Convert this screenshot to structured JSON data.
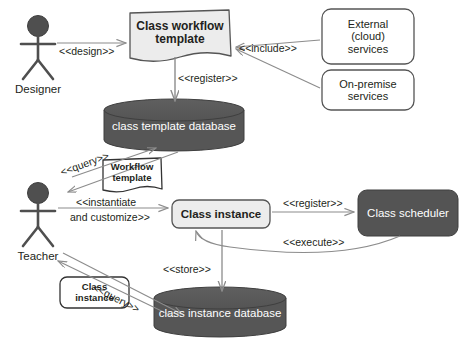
{
  "diagram": {
    "type": "uml-component-diagram",
    "colors": {
      "dark_fill": "#595959",
      "light_fill": "#eeeeee",
      "white_fill": "#ffffff",
      "stroke": "#4d4d4d",
      "text_dark": "#231f20",
      "text_light": "#ffffff",
      "arrow": "#8c8c8c"
    }
  },
  "actors": [
    {
      "id": "designer",
      "name": "Designer",
      "icon": "actor-stick-figure-icon"
    },
    {
      "id": "teacher",
      "name": "Teacher",
      "icon": "actor-stick-figure-icon"
    }
  ],
  "nodes": [
    {
      "id": "class-workflow-template",
      "label": "Class workflow\ntemplate",
      "shape": "document",
      "fill": "light",
      "bold": true
    },
    {
      "id": "external-cloud-services",
      "label": "External\n(cloud)\nservices",
      "shape": "rounded-rect",
      "fill": "white",
      "bold": false
    },
    {
      "id": "on-premise-services",
      "label": "On-premise\nservices",
      "shape": "rounded-rect",
      "fill": "white",
      "bold": false
    },
    {
      "id": "class-template-database",
      "label": "class template database",
      "shape": "cylinder",
      "fill": "dark",
      "bold": false
    },
    {
      "id": "workflow-template-artifact",
      "label": "Workflow\ntemplate",
      "shape": "document",
      "fill": "white",
      "bold": true
    },
    {
      "id": "class-instance",
      "label": "Class instance",
      "shape": "rounded-rect",
      "fill": "light",
      "bold": true
    },
    {
      "id": "class-scheduler",
      "label": "Class scheduler",
      "shape": "rounded-rect",
      "fill": "dark",
      "bold": false
    },
    {
      "id": "class-instance-artifact",
      "label": "Class\ninstance",
      "shape": "rounded-rect",
      "fill": "white",
      "bold": true
    },
    {
      "id": "class-instance-database",
      "label": "class instance database",
      "shape": "cylinder",
      "fill": "dark",
      "bold": false
    }
  ],
  "edges": [
    {
      "id": "design",
      "label": "<<design>>",
      "from": "designer",
      "to": "class-workflow-template"
    },
    {
      "id": "include",
      "label": "<<include>>",
      "from": "external-cloud-services",
      "to": "class-workflow-template"
    },
    {
      "id": "include2",
      "label": "",
      "from": "on-premise-services",
      "to": "class-workflow-template"
    },
    {
      "id": "register1",
      "label": "<<register>>",
      "from": "class-workflow-template",
      "to": "class-template-database"
    },
    {
      "id": "query1",
      "label": "<<query>>",
      "from": "teacher",
      "to": "class-template-database"
    },
    {
      "id": "instantiate",
      "label": "<<instantiate\nand customize>>",
      "from": "teacher",
      "to": "class-instance"
    },
    {
      "id": "register2",
      "label": "<<register>>",
      "from": "class-instance",
      "to": "class-scheduler"
    },
    {
      "id": "execute",
      "label": "<<execute>>",
      "from": "class-scheduler",
      "to": "class-instance"
    },
    {
      "id": "store",
      "label": "<<store>>",
      "from": "class-instance",
      "to": "class-instance-database"
    },
    {
      "id": "query2",
      "label": "<<query>>",
      "from": "teacher",
      "to": "class-instance-database"
    }
  ],
  "edge_labels": {
    "design": "<<design>>",
    "include": "<<include>>",
    "register_top": "<<register>>",
    "query_top": "<<query>>",
    "instantiate_line1": "<<instantiate",
    "instantiate_line2": "and customize>>",
    "register_right": "<<register>>",
    "execute": "<<execute>>",
    "store": "<<store>>",
    "query_bottom": "<<query>>"
  }
}
